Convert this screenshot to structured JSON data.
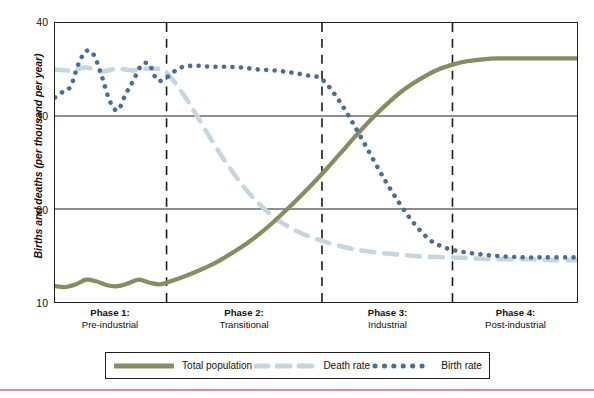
{
  "figure": {
    "name": "demographic-transition-model"
  },
  "axes": {
    "y_label": "Births and deaths (per thousand per year)",
    "y_ticks": [
      "40",
      "30",
      "20",
      "10"
    ],
    "y_tick_values": [
      40,
      30,
      20,
      10
    ],
    "ylim": [
      10,
      40
    ],
    "x_label": "",
    "grid": "horizontal-only"
  },
  "phases": [
    {
      "title": "Phase 1:",
      "subtitle": "Pre-industrial"
    },
    {
      "title": "Phase 2:",
      "subtitle": "Transitional"
    },
    {
      "title": "Phase 3:",
      "subtitle": "Industrial"
    },
    {
      "title": "Phase 4:",
      "subtitle": "Post-industrial"
    }
  ],
  "legend": {
    "position": "below-plot",
    "items": [
      {
        "label": "Total population",
        "style": "solid",
        "color": "#8a8c5f",
        "icon": "solid-line-swatch"
      },
      {
        "label": "Death rate",
        "style": "dashed",
        "color": "#c5d6e0",
        "icon": "dashed-line-swatch"
      },
      {
        "label": "Birth rate",
        "style": "dotted",
        "color": "#4a6f96",
        "icon": "dotted-line-swatch"
      }
    ]
  },
  "colors": {
    "total_population": "#8a8c5f",
    "death_rate": "#c5d6e0",
    "birth_rate": "#4a6f96",
    "axis": "#1f1f1f",
    "gridline": "#1f1f1f",
    "phase_divider": "#1a1a1a",
    "bottom_rule": "#d98f9e",
    "background": "#ffffff"
  },
  "chart_data": {
    "type": "line",
    "title": "",
    "xlabel": "",
    "ylabel": "Births and deaths (per thousand per year)",
    "ylim": [
      10,
      40
    ],
    "xlim": [
      0,
      100
    ],
    "grid": true,
    "legend_position": "bottom",
    "phase_boundaries_x": [
      21.4,
      51.2,
      76.2
    ],
    "series": [
      {
        "name": "Total population",
        "style": "solid",
        "color": "#8a8c5f",
        "x": [
          0,
          2,
          4,
          6,
          8,
          10,
          12,
          14,
          16,
          18,
          20,
          22,
          25,
          28,
          31,
          34,
          37,
          40,
          43,
          46,
          49,
          52,
          55,
          58,
          61,
          64,
          67,
          70,
          73,
          76,
          79,
          82,
          85,
          88,
          91,
          94,
          97,
          100
        ],
        "values": [
          11.7,
          11.6,
          11.9,
          12.4,
          12.2,
          11.8,
          11.7,
          12.0,
          12.4,
          12.1,
          11.9,
          12.2,
          12.8,
          13.5,
          14.3,
          15.3,
          16.4,
          17.7,
          19.2,
          20.8,
          22.5,
          24.3,
          26.2,
          28.1,
          29.9,
          31.5,
          32.9,
          34.0,
          34.9,
          35.5,
          35.9,
          36.1,
          36.2,
          36.2,
          36.2,
          36.2,
          36.2,
          36.2
        ]
      },
      {
        "name": "Death rate",
        "style": "dashed",
        "color": "#c5d6e0",
        "x": [
          0,
          3,
          6,
          9,
          12,
          15,
          18,
          21,
          24,
          27,
          30,
          33,
          36,
          39,
          42,
          45,
          48,
          51,
          54,
          58,
          62,
          66,
          70,
          75,
          80,
          85,
          90,
          95,
          100
        ],
        "values": [
          35.0,
          34.9,
          35.2,
          34.8,
          35.1,
          34.9,
          35.1,
          34.8,
          32.8,
          30.2,
          27.4,
          24.8,
          22.5,
          20.6,
          19.1,
          18.0,
          17.2,
          16.6,
          16.1,
          15.6,
          15.3,
          15.1,
          14.9,
          14.8,
          14.7,
          14.6,
          14.6,
          14.5,
          14.5
        ]
      },
      {
        "name": "Birth rate",
        "style": "dotted",
        "color": "#4a6f96",
        "x": [
          0,
          1.5,
          3,
          4.5,
          6,
          7.5,
          9,
          10.5,
          12,
          13.5,
          15,
          16.5,
          18,
          19.5,
          21,
          24,
          27,
          30,
          33,
          36,
          39,
          42,
          45,
          48,
          51,
          54,
          57,
          60,
          63,
          66,
          69,
          72,
          75,
          78,
          82,
          86,
          90,
          94,
          100
        ],
        "values": [
          32.0,
          32.6,
          33.2,
          35.6,
          37.0,
          36.5,
          34.2,
          31.6,
          30.6,
          32.3,
          33.8,
          35.4,
          35.6,
          33.9,
          34.0,
          35.2,
          35.4,
          35.3,
          35.3,
          35.2,
          35.0,
          34.9,
          34.7,
          34.4,
          34.0,
          32.0,
          29.3,
          26.3,
          23.3,
          20.6,
          18.3,
          16.6,
          15.8,
          15.4,
          15.1,
          14.9,
          14.8,
          14.8,
          14.8
        ]
      }
    ]
  }
}
